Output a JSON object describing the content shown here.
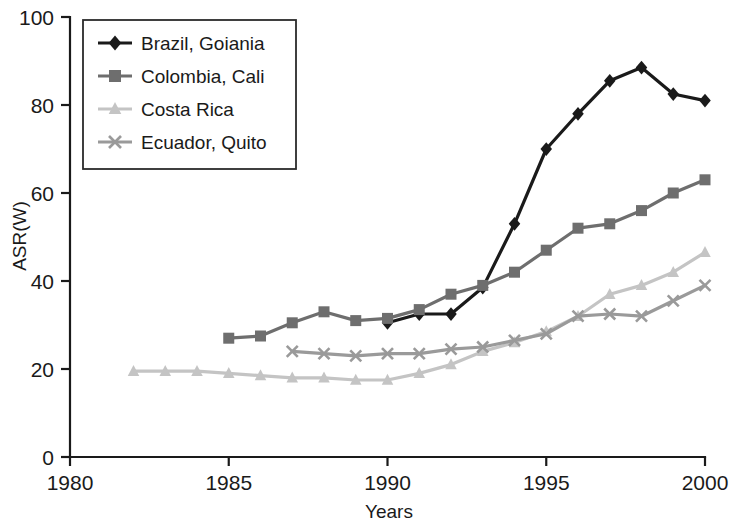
{
  "chart_data": {
    "type": "line",
    "title": "",
    "xlabel": "Years",
    "ylabel": "ASR(W)",
    "xlim": [
      1980,
      2000
    ],
    "ylim": [
      0,
      100
    ],
    "xticks": [
      1980,
      1985,
      1990,
      1995,
      2000
    ],
    "yticks": [
      0,
      20,
      40,
      60,
      80,
      100
    ],
    "grid": false,
    "legend_position": "top-left",
    "series": [
      {
        "name": "Brazil, Goiania",
        "color": "#1a1a1a",
        "marker": "diamond",
        "x": [
          1990,
          1991,
          1992,
          1993,
          1994,
          1995,
          1996,
          1997,
          1998,
          1999,
          2000
        ],
        "values": [
          30.5,
          32.5,
          32.5,
          38.5,
          53,
          70,
          78,
          85.5,
          88.5,
          82.5,
          81
        ]
      },
      {
        "name": "Colombia, Cali",
        "color": "#6e6e6e",
        "marker": "square",
        "x": [
          1985,
          1986,
          1987,
          1988,
          1989,
          1990,
          1991,
          1992,
          1993,
          1994,
          1995,
          1996,
          1997,
          1998,
          1999,
          2000
        ],
        "values": [
          27,
          27.5,
          30.5,
          33,
          31,
          31.5,
          33.5,
          37,
          39,
          42,
          47,
          52,
          53,
          56,
          60,
          63
        ]
      },
      {
        "name": "Costa Rica",
        "color": "#c4c4c4",
        "marker": "triangle",
        "x": [
          1982,
          1983,
          1984,
          1985,
          1986,
          1987,
          1988,
          1989,
          1990,
          1991,
          1992,
          1993,
          1994,
          1995,
          1996,
          1997,
          1998,
          1999,
          2000
        ],
        "values": [
          19.5,
          19.5,
          19.5,
          19,
          18.5,
          18,
          18,
          17.5,
          17.5,
          19,
          21,
          24,
          26,
          28.5,
          32,
          37,
          39,
          42,
          46.5
        ]
      },
      {
        "name": "Ecuador, Quito",
        "color": "#9a9a9a",
        "marker": "cross",
        "x": [
          1987,
          1988,
          1989,
          1990,
          1991,
          1992,
          1993,
          1994,
          1995,
          1996,
          1997,
          1998,
          1999,
          2000
        ],
        "values": [
          24,
          23.5,
          23,
          23.5,
          23.5,
          24.5,
          25,
          26.5,
          28,
          32,
          32.5,
          32,
          35.5,
          39
        ]
      }
    ]
  },
  "axis": {
    "x_title": "Years",
    "y_title": "ASR(W)",
    "x_tick_labels": [
      "1980",
      "1985",
      "1990",
      "1995",
      "2000"
    ],
    "y_tick_labels": [
      "0",
      "20",
      "40",
      "60",
      "80",
      "100"
    ]
  },
  "legend": {
    "items": [
      {
        "label": "Brazil, Goiania",
        "color": "#1a1a1a",
        "marker": "diamond"
      },
      {
        "label": "Colombia, Cali",
        "color": "#6e6e6e",
        "marker": "square"
      },
      {
        "label": "Costa Rica",
        "color": "#c4c4c4",
        "marker": "triangle"
      },
      {
        "label": "Ecuador, Quito",
        "color": "#9a9a9a",
        "marker": "cross"
      }
    ]
  },
  "colors": {
    "brazil": "#1a1a1a",
    "colombia": "#6e6e6e",
    "costa_rica": "#c4c4c4",
    "ecuador": "#9a9a9a",
    "axis": "#1a1a1a",
    "background": "#ffffff"
  }
}
